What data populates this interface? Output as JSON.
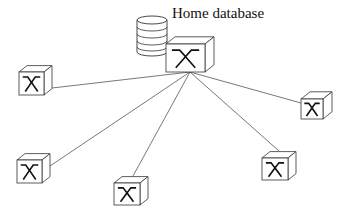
{
  "diagram": {
    "title_label": "Home database",
    "hub": {
      "id": "home-node",
      "role": "home database node"
    },
    "database_icon": "database-cylinder-icon",
    "node_icon": "crossover-switch-icon",
    "nodes": [
      {
        "id": "node-left"
      },
      {
        "id": "node-right"
      },
      {
        "id": "node-bottom-left"
      },
      {
        "id": "node-bottom-center"
      },
      {
        "id": "node-bottom-right"
      }
    ],
    "connections": [
      {
        "from": "home-node",
        "to": "node-left"
      },
      {
        "from": "home-node",
        "to": "node-right"
      },
      {
        "from": "home-node",
        "to": "node-bottom-left"
      },
      {
        "from": "home-node",
        "to": "node-bottom-center"
      },
      {
        "from": "home-node",
        "to": "node-bottom-right"
      }
    ],
    "colors": {
      "stroke": "#333333",
      "line": "#555555",
      "background": "#ffffff"
    }
  }
}
